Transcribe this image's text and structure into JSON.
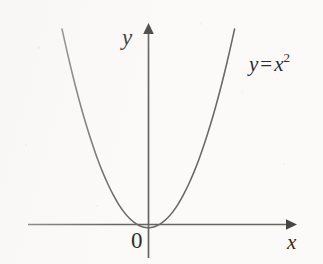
{
  "figure": {
    "background_color": "#fbfaf9",
    "ink_color": "#5f5d5c",
    "text_color": "#2e2c2b"
  },
  "labels": {
    "y_axis": "y",
    "x_axis": "x",
    "origin": "0",
    "equation_variable": "y",
    "equation_equals": "=",
    "equation_base": "x",
    "equation_exponent": "2",
    "equation_full": "y = x²"
  },
  "axes": {
    "x_axis": {
      "start_px": 28,
      "end_px": 293,
      "y_px": 224,
      "arrow": "right"
    },
    "y_axis": {
      "x_px": 148,
      "top_px": 26,
      "bottom_px": 258,
      "arrow": "up"
    }
  },
  "chart_data": {
    "type": "line",
    "title": "",
    "subtitle": "",
    "xlabel": "x",
    "ylabel": "y",
    "function": "y = x^2",
    "annotations": [
      {
        "text": "y = x²",
        "x": 2.45,
        "y": 6.0
      },
      {
        "text": "0",
        "x": -0.2,
        "y": -0.35
      }
    ],
    "legend": [],
    "legend_position": "none",
    "grid": false,
    "xlim": [
      -3.1,
      3.1
    ],
    "ylim": [
      -0.6,
      7.4
    ],
    "axis_ticks": [],
    "series": [
      {
        "name": "y = x²",
        "color": "#6a6865",
        "x": [
          -2.72,
          -2.55,
          -2.38,
          -2.21,
          -2.04,
          -1.87,
          -1.7,
          -1.53,
          -1.36,
          -1.19,
          -1.02,
          -0.85,
          -0.68,
          -0.51,
          -0.34,
          -0.17,
          0.0,
          0.17,
          0.34,
          0.51,
          0.68,
          0.85,
          1.02,
          1.19,
          1.36,
          1.53,
          1.7,
          1.87,
          2.04,
          2.21,
          2.38,
          2.55,
          2.72
        ],
        "values": [
          7.4,
          6.5,
          5.66,
          4.88,
          4.16,
          3.5,
          2.89,
          2.34,
          1.85,
          1.42,
          1.04,
          0.72,
          0.46,
          0.26,
          0.12,
          0.03,
          0.0,
          0.03,
          0.12,
          0.26,
          0.46,
          0.72,
          1.04,
          1.42,
          1.85,
          2.34,
          2.89,
          3.5,
          4.16,
          4.88,
          5.66,
          6.5,
          7.4
        ]
      }
    ]
  }
}
